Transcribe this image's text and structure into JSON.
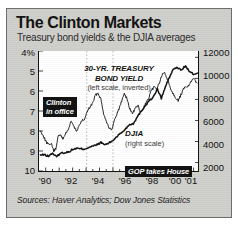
{
  "figure": {
    "title": "The Clinton Markets",
    "subtitle": "Treasury bond yields & the DJIA averages",
    "sources": "Sources: Haver Analytics; Dow Jones Statistics",
    "frame_color": "#cfcfcb",
    "plot_background": "#ffffff",
    "axis_color": "#111111"
  },
  "annotations": {
    "bond_line1": "30-YR. TREASURY",
    "bond_line2": "BOND YIELD",
    "bond_sub": "(left scale, inverted)",
    "djia_label": "DJIA",
    "djia_sub": "(right scale)",
    "clinton_line1": "Clinton",
    "clinton_line2": "in office",
    "gop": "GOP takes House"
  },
  "chart_data": {
    "type": "line",
    "title": "The Clinton Markets",
    "subtitle": "Treasury bond yields & the DJIA averages",
    "xlabel": "",
    "grid": "vertical dotted event markers only",
    "legend": "inline annotations",
    "x_ticks": [
      "'90",
      "'92",
      "'94",
      "'96",
      "'98",
      "'00",
      "'01"
    ],
    "x_tick_values": [
      1990,
      1992,
      1994,
      1996,
      1998,
      2000,
      2001
    ],
    "xlim": [
      1989.5,
      2001.4
    ],
    "axes": [
      {
        "id": "left",
        "name": "30-YR. TREASURY BOND YIELD",
        "ylabel": "percent",
        "ticks": [
          "4%",
          "5",
          "6",
          "7",
          "8",
          "9",
          "10"
        ],
        "tick_values": [
          4,
          5,
          6,
          7,
          8,
          9,
          10
        ],
        "ylim": [
          4,
          10
        ],
        "inverted": true
      },
      {
        "id": "right",
        "name": "DJIA",
        "ylabel": "index level",
        "ticks": [
          "12000",
          "10000",
          "8000",
          "6000",
          "4000",
          "2000"
        ],
        "tick_values": [
          12000,
          10000,
          8000,
          6000,
          4000,
          2000
        ],
        "ylim": [
          1200,
          12600
        ],
        "inverted": false
      }
    ],
    "event_markers": [
      {
        "label": "Clinton in office",
        "x": 1993.05
      },
      {
        "label": "GOP takes House",
        "x": 1995.0
      }
    ],
    "series": [
      {
        "name": "30-YR. TREASURY BOND YIELD",
        "axis": "left",
        "units": "percent",
        "color": "#111111",
        "x": [
          1989.6,
          1989.8,
          1990.0,
          1990.2,
          1990.4,
          1990.6,
          1990.75,
          1990.9,
          1991.1,
          1991.3,
          1991.5,
          1991.7,
          1991.9,
          1992.1,
          1992.3,
          1992.5,
          1992.7,
          1992.9,
          1993.1,
          1993.3,
          1993.5,
          1993.7,
          1993.9,
          1994.1,
          1994.3,
          1994.5,
          1994.7,
          1994.9,
          1995.05,
          1995.25,
          1995.45,
          1995.65,
          1995.85,
          1996.05,
          1996.25,
          1996.45,
          1996.65,
          1996.85,
          1997.05,
          1997.25,
          1997.45,
          1997.65,
          1997.85,
          1998.05,
          1998.25,
          1998.45,
          1998.65,
          1998.85,
          1999.05,
          1999.25,
          1999.45,
          1999.65,
          1999.85,
          2000.05,
          2000.25,
          2000.45,
          2000.65,
          2000.85,
          2001.05,
          2001.25
        ],
        "y": [
          8.0,
          8.2,
          8.5,
          8.7,
          8.6,
          9.0,
          8.9,
          8.3,
          8.2,
          8.4,
          8.1,
          7.9,
          7.5,
          7.8,
          8.0,
          7.7,
          7.5,
          7.4,
          7.0,
          6.8,
          6.6,
          6.2,
          6.1,
          6.4,
          7.1,
          7.5,
          7.8,
          8.0,
          7.6,
          7.2,
          6.9,
          6.5,
          6.1,
          6.4,
          6.9,
          7.1,
          6.9,
          6.7,
          7.1,
          6.9,
          6.6,
          6.4,
          6.0,
          5.8,
          5.9,
          5.6,
          5.2,
          5.1,
          5.4,
          5.8,
          6.1,
          6.3,
          6.5,
          6.2,
          5.9,
          5.8,
          5.7,
          5.5,
          5.4,
          5.6
        ]
      },
      {
        "name": "DJIA",
        "axis": "right",
        "units": "index",
        "color": "#111111",
        "x": [
          1989.6,
          1989.9,
          1990.2,
          1990.5,
          1990.8,
          1991.1,
          1991.4,
          1991.7,
          1992.0,
          1992.3,
          1992.6,
          1992.9,
          1993.2,
          1993.5,
          1993.8,
          1994.1,
          1994.4,
          1994.7,
          1995.0,
          1995.3,
          1995.6,
          1995.9,
          1996.2,
          1996.5,
          1996.8,
          1997.1,
          1997.4,
          1997.7,
          1998.0,
          1998.3,
          1998.6,
          1998.9,
          1999.2,
          1999.5,
          1999.8,
          2000.1,
          2000.4,
          2000.7,
          2001.0,
          2001.3
        ],
        "y": [
          2700,
          2750,
          2600,
          2900,
          2550,
          2900,
          2950,
          3000,
          3250,
          3350,
          3300,
          3300,
          3450,
          3550,
          3700,
          3900,
          3700,
          3850,
          4100,
          4500,
          4800,
          5150,
          5600,
          5700,
          6300,
          6900,
          7400,
          7900,
          8200,
          9000,
          8100,
          9200,
          10100,
          10900,
          11000,
          10800,
          11200,
          10600,
          10400,
          10500
        ]
      }
    ]
  }
}
